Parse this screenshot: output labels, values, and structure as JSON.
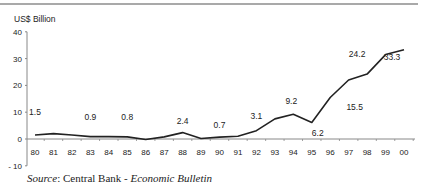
{
  "chart_data": {
    "type": "line",
    "title": "",
    "ylabel": "US$ Billion",
    "xlabel": "",
    "categories": [
      "80",
      "81",
      "82",
      "83",
      "84",
      "85",
      "86",
      "87",
      "88",
      "89",
      "90",
      "91",
      "92",
      "93",
      "94",
      "95",
      "96",
      "97",
      "98",
      "99",
      "00"
    ],
    "series": [
      {
        "name": "US$ Billion",
        "values": [
          1.5,
          2.0,
          1.5,
          0.9,
          0.9,
          0.8,
          -0.2,
          0.8,
          2.4,
          0.2,
          0.7,
          1.0,
          3.1,
          7.5,
          9.2,
          6.2,
          15.5,
          22.0,
          24.2,
          31.5,
          33.3
        ]
      }
    ],
    "data_labels": [
      {
        "category": "80",
        "text": "1.5"
      },
      {
        "category": "83",
        "text": "0.9"
      },
      {
        "category": "85",
        "text": "0.8"
      },
      {
        "category": "88",
        "text": "2.4"
      },
      {
        "category": "90",
        "text": "0.7"
      },
      {
        "category": "92",
        "text": "3.1"
      },
      {
        "category": "94",
        "text": "9.2"
      },
      {
        "category": "95",
        "text": "6.2"
      },
      {
        "category": "97",
        "text": "15.5"
      },
      {
        "category": "98",
        "text": "24.2"
      },
      {
        "category": "00",
        "text": "33.3"
      }
    ],
    "yticks": [
      40,
      30,
      20,
      10,
      0,
      -10
    ],
    "ylim": [
      -10,
      40
    ],
    "grid": false,
    "legend": "none"
  },
  "source": {
    "prefix": "Source",
    "sep": ": Central Bank - ",
    "title": "Economic Bulletin"
  }
}
